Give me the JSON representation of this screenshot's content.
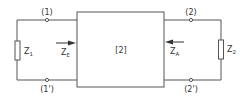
{
  "diagram": {
    "type": "two-port network with source and load impedances",
    "box_label": "[2]",
    "terminals": {
      "port1_top": "(1)",
      "port1_bottom": "(1')",
      "port2_top": "(2)",
      "port2_bottom": "(2')"
    },
    "impedances": {
      "left_load": {
        "main": "Z",
        "sub": "1"
      },
      "right_load": {
        "main": "Z",
        "sub": "2"
      },
      "input": {
        "main": "Z",
        "sub": "E"
      },
      "output": {
        "main": "Z",
        "sub": "A"
      }
    },
    "line_color": "#555555"
  }
}
